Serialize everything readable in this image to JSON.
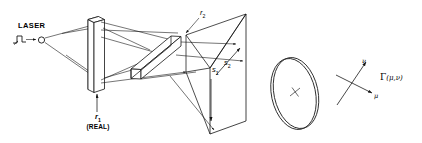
{
  "figure": {
    "background_color": "#ffffff",
    "line_color": "#141414",
    "labels": {
      "laser": "LASER",
      "r1": "r",
      "r1_sub": "1",
      "real": "(REAL)",
      "r2": "r",
      "r2_sub": "2",
      "s1": "s",
      "s1_sub": "1",
      "s2": "s",
      "s2_sub": "2",
      "nu": "ν",
      "mu": "μ",
      "gamma": "Γ",
      "gamma_args": "(μ,ν)"
    },
    "elements": {
      "laser_source": "laser-point-source",
      "pulse_symbol": "step-pulse-waveform",
      "plate1": "vertical-holographic-plate",
      "plate2": "tilted-holographic-plate",
      "screen": "projection-screen-wireframe",
      "disk": "circular-aperture-disk",
      "axes": "mu-nu-coordinate-axes",
      "function": "gamma-function-notation"
    }
  }
}
